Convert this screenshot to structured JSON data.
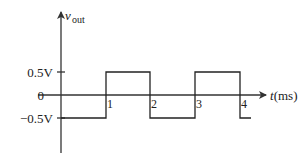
{
  "chart_data": {
    "type": "line",
    "title": "",
    "xlabel": "t(ms)",
    "ylabel": "v_out",
    "ylabel_main": "v",
    "ylabel_sub": "out",
    "x_ticks": [
      "1",
      "2",
      "3",
      "4"
    ],
    "y_ticks": [
      "0.5V",
      "0",
      "-0.5V"
    ],
    "y_tick_labels": {
      "pos": "0.5V",
      "zero": "0",
      "neg": "−0.5V"
    },
    "xlim": [
      0,
      4.25
    ],
    "ylim": [
      -0.5,
      0.5
    ],
    "grid": false,
    "legend": null,
    "series": [
      {
        "name": "v_out (square wave)",
        "x": [
          0,
          1,
          1,
          2,
          2,
          3,
          3,
          4,
          4,
          4.25
        ],
        "y": [
          -0.5,
          -0.5,
          0.5,
          0.5,
          -0.5,
          -0.5,
          0.5,
          0.5,
          -0.5,
          -0.5
        ]
      }
    ]
  },
  "colors": {
    "line": "#222222",
    "axis": "#333333",
    "background": "#ffffff"
  }
}
